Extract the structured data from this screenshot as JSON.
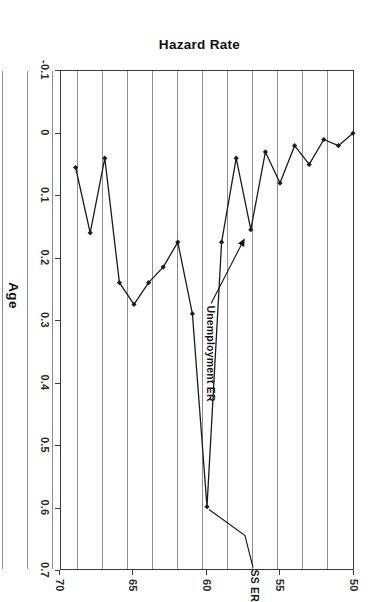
{
  "chart_data": {
    "type": "line",
    "title": "",
    "xlabel": "Age",
    "ylabel": "Hazard Rate",
    "xlim": [
      50,
      70
    ],
    "ylim": [
      -0.1,
      0.7
    ],
    "xticks": [
      50,
      55,
      60,
      65,
      70
    ],
    "xtick_labels": [
      "50",
      "55",
      "60",
      "65",
      "70"
    ],
    "yticks": [
      -0.1,
      0,
      0.1,
      0.2,
      0.3,
      0.4,
      0.5,
      0.6,
      0.7
    ],
    "ytick_labels": [
      "-0.1",
      "0",
      "0.1",
      "0.2",
      "0.3",
      "0.4",
      "0.5",
      "0.6",
      "0.7"
    ],
    "grid": "horizontal-gridlines-at-each-age",
    "legend": "none",
    "marker": "filled-diamond",
    "line_color": "#1a1a1a",
    "grid_color": "#8d8d8d",
    "frame_color": "#3a3a3a",
    "x": [
      50,
      51,
      52,
      53,
      54,
      55,
      56,
      57,
      58,
      59,
      60,
      61,
      62,
      63,
      64,
      65,
      66,
      67,
      68,
      69
    ],
    "series": [
      {
        "name": "Hazard Rate",
        "values": [
          0.0,
          0.02,
          0.01,
          0.05,
          0.02,
          0.08,
          0.03,
          0.155,
          0.04,
          0.175,
          0.6,
          0.29,
          0.175,
          0.215,
          0.24,
          0.275,
          0.24,
          0.04,
          0.16,
          0.055
        ]
      }
    ],
    "annotations": [
      {
        "id": "ss-er",
        "text": "SS ER",
        "points_to_x": 60,
        "points_to_y": 0.6,
        "style": "leader-line"
      },
      {
        "id": "unemployment-er",
        "text": "Unemployment ER",
        "points_to_x": 57,
        "points_to_y": 0.155,
        "style": "arrow"
      }
    ]
  }
}
